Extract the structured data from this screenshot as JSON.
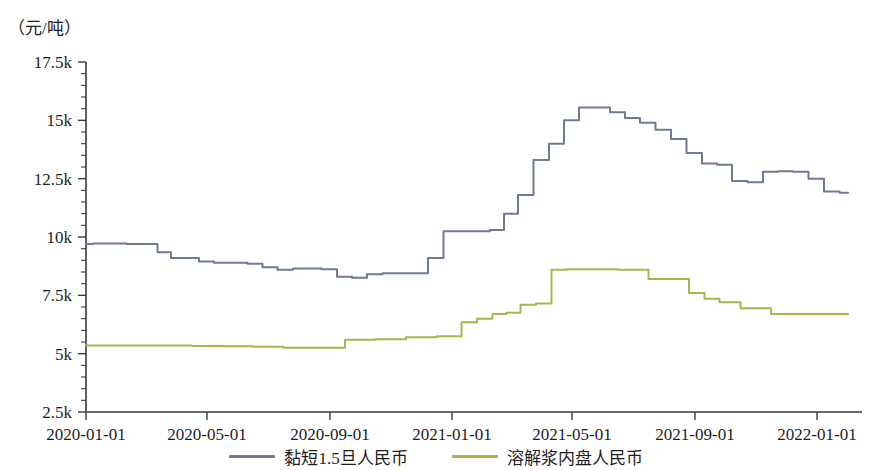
{
  "chart_data": {
    "type": "line",
    "title": "",
    "subtitle": "",
    "xlabel": "",
    "ylabel": "（元/吨）",
    "unit_label": "（元/吨）",
    "grid": false,
    "legend_position": "bottom",
    "xlim": [
      "2020-01-01",
      "2022-02-15"
    ],
    "ylim": [
      2500,
      17500
    ],
    "ytick_labels": [
      "2.5k",
      "5k",
      "7.5k",
      "10k",
      "12.5k",
      "15k",
      "17.5k"
    ],
    "ytick_values": [
      2500,
      5000,
      7500,
      10000,
      12500,
      15000,
      17500
    ],
    "yminor_step": 500,
    "xtick_labels": [
      "2020-01-01",
      "2020-05-01",
      "2020-09-01",
      "2021-01-01",
      "2021-05-01",
      "2021-09-01",
      "2022-01-01"
    ],
    "series": [
      {
        "name": "黏短1.5旦人民币",
        "color": "#6f7a96",
        "x": [
          "2020-01-01",
          "2020-01-15",
          "2020-02-01",
          "2020-02-20",
          "2020-03-05",
          "2020-03-20",
          "2020-04-01",
          "2020-04-15",
          "2020-05-01",
          "2020-05-15",
          "2020-06-01",
          "2020-06-20",
          "2020-07-01",
          "2020-07-20",
          "2020-08-01",
          "2020-08-15",
          "2020-09-01",
          "2020-09-15",
          "2020-10-01",
          "2020-10-15",
          "2020-11-01",
          "2020-11-15",
          "2020-12-01",
          "2020-12-15",
          "2021-01-01",
          "2021-01-15",
          "2021-02-01",
          "2021-02-15",
          "2021-03-01",
          "2021-03-15",
          "2021-04-01",
          "2021-04-15",
          "2021-05-01",
          "2021-05-15",
          "2021-06-01",
          "2021-06-15",
          "2021-07-01",
          "2021-07-15",
          "2021-08-01",
          "2021-08-15",
          "2021-09-01",
          "2021-09-15",
          "2021-10-01",
          "2021-10-15",
          "2021-11-01",
          "2021-11-15",
          "2021-12-01",
          "2021-12-15",
          "2022-01-01",
          "2022-01-15",
          "2022-02-01"
        ],
        "values": [
          9700,
          9720,
          9720,
          9700,
          9700,
          9350,
          9100,
          9100,
          8950,
          8900,
          8900,
          8850,
          8700,
          8600,
          8650,
          8650,
          8620,
          8300,
          8250,
          8400,
          8450,
          8450,
          8450,
          9100,
          10250,
          10250,
          10250,
          10300,
          11000,
          11800,
          13300,
          14000,
          15000,
          15550,
          15550,
          15350,
          15100,
          14900,
          14600,
          14200,
          13600,
          13150,
          13100,
          12400,
          12350,
          12800,
          12820,
          12800,
          12500,
          11950,
          11900
        ],
        "first_value": 9700,
        "min_value": 8250,
        "max_value": 15550,
        "last_value": 12900
      },
      {
        "name": "溶解浆内盘人民币",
        "color": "#a9b44d",
        "x": [
          "2020-01-01",
          "2020-02-01",
          "2020-03-01",
          "2020-04-01",
          "2020-05-01",
          "2020-06-01",
          "2020-07-01",
          "2020-08-01",
          "2020-09-01",
          "2020-10-01",
          "2020-11-01",
          "2020-12-01",
          "2021-01-01",
          "2021-01-20",
          "2021-02-01",
          "2021-02-20",
          "2021-03-01",
          "2021-03-20",
          "2021-04-01",
          "2021-04-20",
          "2021-05-01",
          "2021-06-01",
          "2021-07-01",
          "2021-08-01",
          "2021-08-20",
          "2021-09-01",
          "2021-09-20",
          "2021-10-01",
          "2021-11-01",
          "2021-12-01",
          "2022-01-01",
          "2022-02-01"
        ],
        "values": [
          5350,
          5350,
          5350,
          5350,
          5330,
          5320,
          5300,
          5250,
          5250,
          5600,
          5620,
          5700,
          5750,
          6350,
          6500,
          6700,
          6750,
          7100,
          7150,
          8600,
          8620,
          8620,
          8600,
          8200,
          8200,
          7600,
          7350,
          7200,
          6950,
          6700,
          6700,
          6700
        ],
        "first_value": 5350,
        "min_value": 5250,
        "max_value": 8620,
        "last_value": 6700
      }
    ]
  },
  "legend": {
    "items": [
      {
        "label": "黏短1.5旦人民币",
        "color": "#6f7a96"
      },
      {
        "label": "溶解浆内盘人民币",
        "color": "#a9b44d"
      }
    ]
  }
}
